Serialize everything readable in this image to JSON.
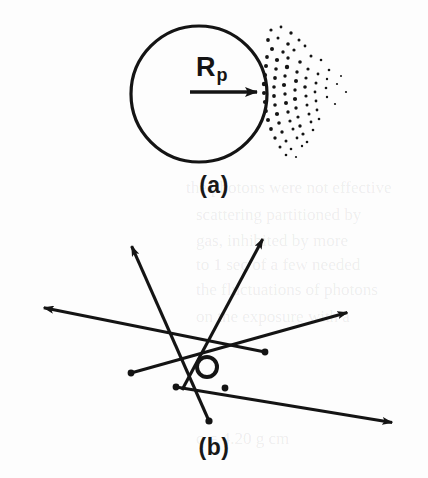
{
  "figure": {
    "background_color": "#fdfdfd",
    "ink_color": "#141414"
  },
  "panel_a": {
    "caption": "(a)",
    "radius_symbol": "R",
    "radius_subscript": "p",
    "circle": {
      "cx": 199,
      "cy": 94,
      "r": 68,
      "stroke_width": 3.2
    },
    "arrow": {
      "x1": 190,
      "y1": 92,
      "x2": 264,
      "y2": 92,
      "stroke_width": 3.4
    },
    "stipple_note": "dot cloud emanating rightward from circle edge",
    "stipple_dots": [
      [
        271,
        30,
        1.6
      ],
      [
        281,
        27,
        1.4
      ],
      [
        291,
        33,
        1.7
      ],
      [
        268,
        40,
        1.9
      ],
      [
        278,
        38,
        1.5
      ],
      [
        288,
        44,
        1.8
      ],
      [
        299,
        40,
        1.5
      ],
      [
        272,
        49,
        2.0
      ],
      [
        283,
        52,
        1.7
      ],
      [
        294,
        50,
        1.6
      ],
      [
        305,
        46,
        1.4
      ],
      [
        267,
        57,
        1.9
      ],
      [
        277,
        60,
        2.1
      ],
      [
        288,
        58,
        1.7
      ],
      [
        300,
        62,
        1.8
      ],
      [
        311,
        56,
        1.5
      ],
      [
        321,
        60,
        1.3
      ],
      [
        266,
        66,
        2.0
      ],
      [
        276,
        69,
        1.8
      ],
      [
        287,
        67,
        2.2
      ],
      [
        297,
        72,
        1.7
      ],
      [
        308,
        69,
        1.6
      ],
      [
        318,
        74,
        1.4
      ],
      [
        329,
        70,
        1.3
      ],
      [
        265,
        75,
        2.1
      ],
      [
        275,
        78,
        1.9
      ],
      [
        285,
        76,
        1.7
      ],
      [
        296,
        81,
        2.0
      ],
      [
        306,
        78,
        1.6
      ],
      [
        316,
        83,
        1.5
      ],
      [
        327,
        79,
        1.2
      ],
      [
        337,
        84,
        1.1
      ],
      [
        264,
        84,
        2.2
      ],
      [
        274,
        87,
        1.8
      ],
      [
        284,
        85,
        2.1
      ],
      [
        295,
        90,
        1.7
      ],
      [
        305,
        87,
        1.8
      ],
      [
        315,
        92,
        1.4
      ],
      [
        326,
        88,
        1.3
      ],
      [
        264,
        93,
        2.0
      ],
      [
        274,
        96,
        1.9
      ],
      [
        285,
        94,
        1.7
      ],
      [
        295,
        99,
        2.1
      ],
      [
        306,
        96,
        1.6
      ],
      [
        316,
        101,
        1.4
      ],
      [
        327,
        97,
        1.2
      ],
      [
        265,
        102,
        2.1
      ],
      [
        275,
        105,
        1.8
      ],
      [
        286,
        103,
        2.0
      ],
      [
        296,
        108,
        1.7
      ],
      [
        307,
        105,
        1.5
      ],
      [
        317,
        110,
        1.4
      ],
      [
        266,
        111,
        1.9
      ],
      [
        277,
        114,
        2.1
      ],
      [
        288,
        112,
        1.7
      ],
      [
        298,
        117,
        1.6
      ],
      [
        309,
        114,
        1.5
      ],
      [
        319,
        119,
        1.3
      ],
      [
        268,
        120,
        2.0
      ],
      [
        279,
        123,
        1.8
      ],
      [
        290,
        121,
        1.6
      ],
      [
        300,
        126,
        1.7
      ],
      [
        311,
        122,
        1.4
      ],
      [
        271,
        129,
        1.9
      ],
      [
        282,
        132,
        1.7
      ],
      [
        293,
        129,
        1.5
      ],
      [
        303,
        134,
        1.6
      ],
      [
        313,
        130,
        1.3
      ],
      [
        275,
        138,
        1.7
      ],
      [
        286,
        141,
        1.5
      ],
      [
        297,
        138,
        1.4
      ],
      [
        307,
        142,
        1.3
      ],
      [
        280,
        147,
        1.5
      ],
      [
        291,
        149,
        1.3
      ],
      [
        302,
        146,
        1.2
      ],
      [
        286,
        155,
        1.3
      ],
      [
        296,
        157,
        1.1
      ],
      [
        346,
        92,
        1.1
      ],
      [
        341,
        76,
        1.0
      ],
      [
        335,
        104,
        1.1
      ]
    ]
  },
  "panel_b": {
    "caption": "(b)",
    "scatter_circle": {
      "cx": 207,
      "cy": 367,
      "r": 10,
      "stroke_width": 4
    },
    "trajectories": [
      {
        "name": "up-left-arrow",
        "from": [
          209,
          421
        ],
        "to": [
          128,
          238
        ],
        "arrow_at": "to"
      },
      {
        "name": "up-right-arrow",
        "from": [
          182,
          390
        ],
        "to": [
          267,
          231
        ],
        "arrow_at": "to"
      },
      {
        "name": "left-arrow",
        "from": [
          265,
          352
        ],
        "to": [
          35,
          306
        ],
        "arrow_at": "to"
      },
      {
        "name": "right-arrow",
        "from": [
          131,
          373
        ],
        "to": [
          356,
          310
        ],
        "arrow_at": "to"
      },
      {
        "name": "down-right-arrow",
        "from": [
          176,
          387
        ],
        "to": [
          401,
          424
        ],
        "arrow_at": "to"
      }
    ],
    "scatter_points": [
      {
        "name": "point-left",
        "x": 131,
        "y": 373,
        "r": 3.4
      },
      {
        "name": "point-lower-left",
        "x": 176,
        "y": 387,
        "r": 3.4
      },
      {
        "name": "point-lower-center",
        "x": 225,
        "y": 388,
        "r": 3.4
      },
      {
        "name": "point-right",
        "x": 265,
        "y": 352,
        "r": 3.4
      },
      {
        "name": "point-bottom",
        "x": 209,
        "y": 421,
        "r": 3.6
      }
    ]
  },
  "ghost_text": {
    "note": "faint show-through text from reverse of scanned page",
    "lines": [
      {
        "text": "the photons were not effective",
        "x": 186,
        "y": 186
      },
      {
        "text": "scattering partitioned by",
        "x": 196,
        "y": 213
      },
      {
        "text": "gas, inhibited by more",
        "x": 196,
        "y": 239
      },
      {
        "text": "to 1 sec of a few needed",
        "x": 196,
        "y": 263
      },
      {
        "text": "the fluctuations of photons",
        "x": 196,
        "y": 288
      },
      {
        "text": "on the exposure with a",
        "x": 196,
        "y": 315
      },
      {
        "text": "c = 4.20 g cm",
        "x": 196,
        "y": 437
      }
    ]
  }
}
